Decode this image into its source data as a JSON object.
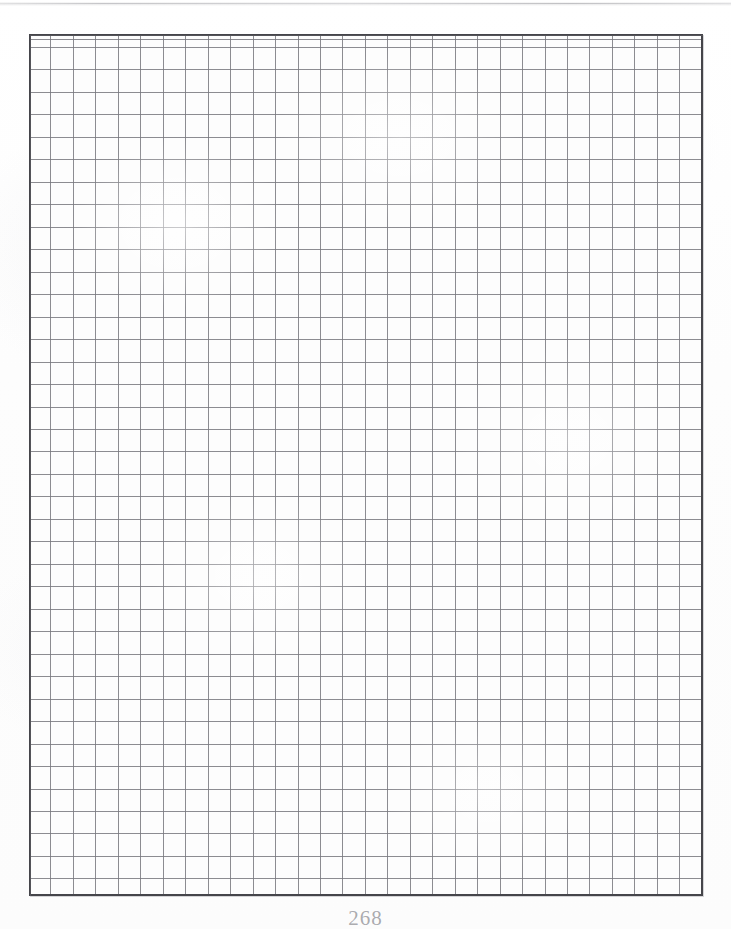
{
  "page": {
    "kind": "scanned-book-page",
    "content_type": "blank-graph-paper",
    "folio": "268",
    "background_color": "#ffffff",
    "paper_color": "#fdfdfd"
  },
  "artifacts": {
    "top_scan_line": {
      "name": "scan-edge-artifact",
      "color": "#c4c4c6"
    }
  },
  "grid": {
    "label": "graph-paper-grid",
    "border_color": "#45454a",
    "line_color": "#787880",
    "columns": 30,
    "rows": 38,
    "cell_width_px": 22.46,
    "cell_height_px": 22.47,
    "left_px": 29,
    "top_px": 34,
    "width_px": 674,
    "height_px": 862,
    "partial_first_row_px": 13,
    "partial_last_column_px": 8
  }
}
